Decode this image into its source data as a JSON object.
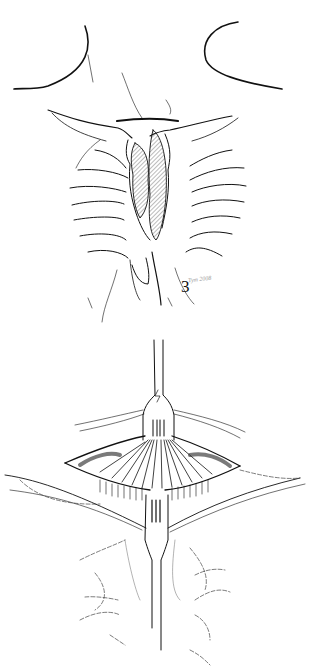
{
  "document": {
    "type": "surgical illustration plate",
    "figures": [
      {
        "id": "3",
        "label": "3",
        "subject": "anterior chest wall with rib cage, sternum and shaded retrosternal mass; horizontal incision line above sternal notch",
        "signature": "Tym 2008"
      },
      {
        "id": "4",
        "label": "4",
        "subject": "transverse cervical incision with fork-shaped retractors exposing strap muscles; dashed outline of ribs below",
        "signature": "tym 98"
      }
    ],
    "stray_mark": ":"
  },
  "colors": {
    "background": "#ffffff",
    "ink": "#111111",
    "hatch": "#555555",
    "faint": "#999999"
  }
}
